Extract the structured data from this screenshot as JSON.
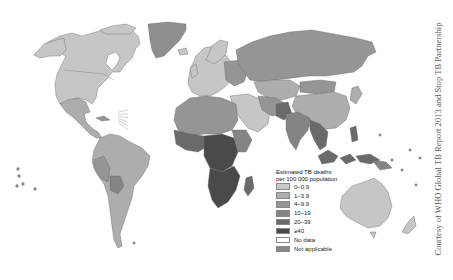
{
  "map": {
    "title": "Estimated TB death rates per country",
    "legend": {
      "title_line1": "Estimated TB deaths",
      "title_line2": "per 100 000 population",
      "items": [
        {
          "label": "0–0.9",
          "color": "#c9c9c9"
        },
        {
          "label": "1–3.9",
          "color": "#adadad"
        },
        {
          "label": "4–9.9",
          "color": "#959595"
        },
        {
          "label": "10–19",
          "color": "#848484"
        },
        {
          "label": "20–39",
          "color": "#6a6a6a"
        },
        {
          "label": "≥40",
          "color": "#4a4a4a"
        },
        {
          "label": "No data",
          "color": "#ffffff"
        },
        {
          "label": "Not applicable",
          "color": "#8a8a8a"
        }
      ]
    },
    "credit": "Courtesy of WHO Global TB Report 2013 and Stop TB Partnership",
    "colors": {
      "border": "#555555",
      "ocean": "#ffffff"
    }
  }
}
